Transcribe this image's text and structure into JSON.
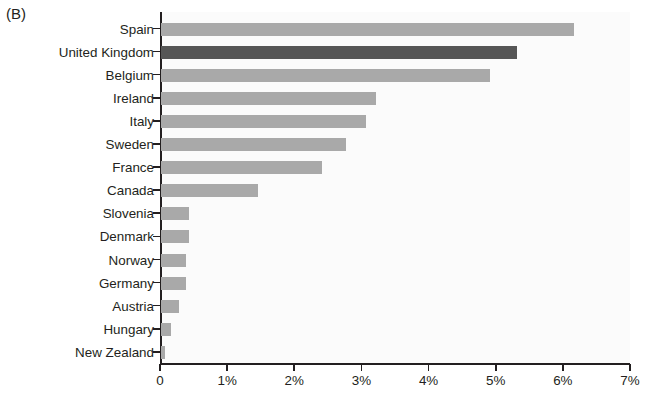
{
  "panel": {
    "label": "(B)"
  },
  "chart_data": {
    "type": "bar",
    "orientation": "horizontal",
    "title": "",
    "xlabel": "",
    "ylabel": "",
    "xlim": [
      0,
      7
    ],
    "xtick_labels": [
      "0",
      "1%",
      "2%",
      "3%",
      "4%",
      "5%",
      "6%",
      "7%"
    ],
    "xticks": [
      0,
      1,
      2,
      3,
      4,
      5,
      6,
      7
    ],
    "grid": false,
    "legend": "none",
    "categories": [
      "Spain",
      "United Kingdom",
      "Belgium",
      "Ireland",
      "Italy",
      "Sweden",
      "France",
      "Canada",
      "Slovenia",
      "Denmark",
      "Norway",
      "Germany",
      "Austria",
      "Hungary",
      "New Zealand"
    ],
    "values": [
      6.15,
      5.3,
      4.9,
      3.2,
      3.05,
      2.75,
      2.4,
      1.45,
      0.42,
      0.42,
      0.37,
      0.37,
      0.27,
      0.15,
      0.06
    ],
    "highlight_category": "United Kingdom",
    "colors": {
      "bar": "#a9a9a9",
      "bar_highlight": "#565656",
      "axis": "#231f20",
      "plot_background": "#fbfbfb",
      "text": "#231f20"
    }
  }
}
